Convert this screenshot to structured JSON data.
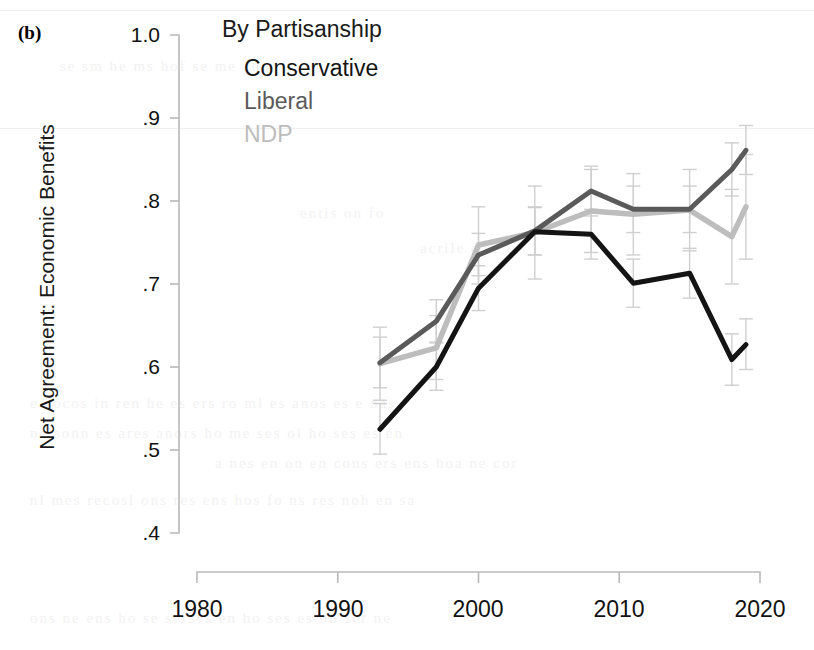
{
  "panel": {
    "label": "(b)"
  },
  "legend": {
    "title": "By Partisanship",
    "entries": [
      {
        "label": "Conservative",
        "color": "#141414"
      },
      {
        "label": "Liberal",
        "color": "#5a5a5a"
      },
      {
        "label": "NDP",
        "color": "#bdbdbd"
      }
    ]
  },
  "axes": {
    "y_title": "Net Agreement: Economic Benefits",
    "y_ticks": [
      "1.0",
      ".9",
      ".8",
      ".7",
      ".6",
      ".5",
      ".4"
    ],
    "x_ticks": [
      "1980",
      "1990",
      "2000",
      "2010",
      "2020"
    ]
  },
  "chart_data": {
    "type": "line",
    "title": "By Partisanship",
    "panel_label": "(b)",
    "xlabel": "",
    "ylabel": "Net Agreement: Economic Benefits",
    "xlim": [
      1978,
      2021
    ],
    "ylim": [
      0.4,
      1.0
    ],
    "yticks": [
      0.4,
      0.5,
      0.6,
      0.7,
      0.8,
      0.9,
      1.0
    ],
    "ytick_labels": [
      ".4",
      ".5",
      ".6",
      ".7",
      ".8",
      ".9",
      "1.0"
    ],
    "xticks": [
      1980,
      1990,
      2000,
      2010,
      2020
    ],
    "grid": false,
    "legend_position": "top-center",
    "error_bars": true,
    "x": [
      1993,
      1997,
      2000,
      2004,
      2008,
      2011,
      2015,
      2018,
      2019
    ],
    "series": [
      {
        "name": "Conservative",
        "color": "#141414",
        "values": [
          0.525,
          0.6,
          0.695,
          0.763,
          0.76,
          0.701,
          0.713,
          0.609,
          0.627
        ],
        "err_low": [
          0.495,
          0.572,
          0.668,
          0.735,
          0.73,
          0.672,
          0.683,
          0.578,
          0.597
        ],
        "err_high": [
          0.556,
          0.629,
          0.722,
          0.792,
          0.79,
          0.73,
          0.743,
          0.64,
          0.658
        ]
      },
      {
        "name": "Liberal",
        "color": "#5a5a5a",
        "values": [
          0.605,
          0.655,
          0.735,
          0.764,
          0.812,
          0.79,
          0.79,
          0.838,
          0.861
        ],
        "err_low": [
          0.575,
          0.63,
          0.71,
          0.735,
          0.782,
          0.762,
          0.762,
          0.806,
          0.832
        ],
        "err_high": [
          0.636,
          0.681,
          0.761,
          0.793,
          0.842,
          0.818,
          0.818,
          0.87,
          0.891
        ]
      },
      {
        "name": "NDP",
        "color": "#bdbdbd",
        "values": [
          0.604,
          0.623,
          0.747,
          0.762,
          0.788,
          0.784,
          0.789,
          0.757,
          0.793
        ],
        "err_low": [
          0.56,
          0.585,
          0.7,
          0.706,
          0.738,
          0.735,
          0.74,
          0.7,
          0.73
        ],
        "err_high": [
          0.648,
          0.662,
          0.793,
          0.818,
          0.838,
          0.833,
          0.838,
          0.814,
          0.856
        ]
      }
    ]
  }
}
